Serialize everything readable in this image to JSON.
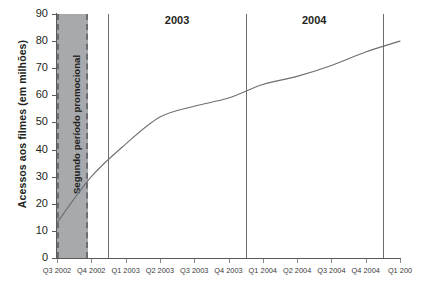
{
  "chart_data": {
    "type": "line",
    "title": "",
    "xlabel": "",
    "ylabel": "Acessos aos filmes (em milhões)",
    "ylim": [
      0,
      90
    ],
    "ytick_step": 10,
    "yticks": [
      0,
      10,
      20,
      30,
      40,
      50,
      60,
      70,
      80,
      90
    ],
    "grid": false,
    "legend": "none",
    "categories": [
      "Q3 2002",
      "Q4 2002",
      "Q1 2003",
      "Q2 2003",
      "Q3 2003",
      "Q4 2003",
      "Q1 2004",
      "Q2 2004",
      "Q3 2004",
      "Q4 2004",
      "Q1 200"
    ],
    "series": [
      {
        "name": "Acessos aos filmes",
        "color": "#6d6e71",
        "values": [
          13,
          30,
          42,
          52,
          56,
          59,
          64,
          67,
          71,
          76,
          80
        ]
      }
    ],
    "annotations": {
      "band": {
        "label": "Segundo período promocional",
        "from": "Q3 2002",
        "to": "Q4 2002",
        "fill": "#a7a9ac",
        "border": "#6d6e71"
      },
      "year_markers": [
        {
          "label": "2003",
          "after": "Q4 2002"
        },
        {
          "label": "2004",
          "after": "Q4 2003"
        },
        {
          "label": "",
          "after": "Q4 2004"
        }
      ]
    }
  },
  "axes": {
    "y": {
      "title": "Acessos aos filmes (em milhões)",
      "ticks": [
        "90",
        "80",
        "70",
        "60",
        "50",
        "40",
        "30",
        "20",
        "10",
        "0"
      ]
    },
    "x": {
      "ticks": [
        "Q3 2002",
        "Q4 2002",
        "Q1 2003",
        "Q2 2003",
        "Q3 2003",
        "Q4 2003",
        "Q1 2004",
        "Q2 2004",
        "Q3 2004",
        "Q4 2004",
        "Q1 200"
      ]
    }
  },
  "band": {
    "label": "Segundo período promocional"
  },
  "years": [
    {
      "label": "2003"
    },
    {
      "label": "2004"
    }
  ]
}
